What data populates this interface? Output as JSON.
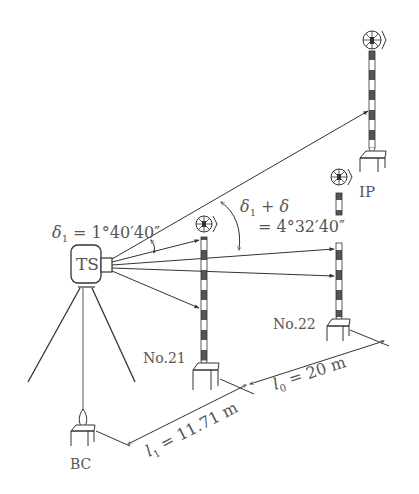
{
  "diagram": {
    "instrument": {
      "label": "TS"
    },
    "points": {
      "ip": {
        "label": "IP"
      },
      "no21": {
        "label": "No.21"
      },
      "no22": {
        "label": "No.22"
      },
      "bc": {
        "label": "BC"
      }
    },
    "angles": {
      "delta1": {
        "symbol": "δ",
        "sub": "1",
        "value": " = 1°40′40″"
      },
      "delta1_plus_delta": {
        "symbol": "δ",
        "sub": "1",
        "plus": " + δ",
        "value": "= 4°32′40″"
      }
    },
    "distances": {
      "l1": {
        "symbol": "l",
        "sub": "1",
        "value": " = 11.71 m"
      },
      "l0": {
        "symbol": "l",
        "sub": "0",
        "value": " = 20 m"
      }
    },
    "colors": {
      "line": "#333333",
      "text": "#555555",
      "stripe": "#555555"
    }
  }
}
